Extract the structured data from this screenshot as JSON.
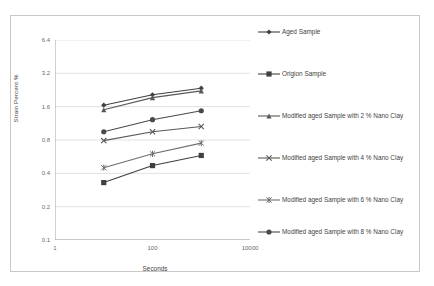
{
  "chart_data": {
    "type": "line",
    "title": "",
    "xlabel": "Seconds",
    "ylabel": "Strain Percent %",
    "xscale": "log",
    "yscale": "log",
    "xlim": [
      1,
      10000
    ],
    "ylim": [
      0.1,
      6.4
    ],
    "xticks": [
      "1",
      "100",
      "10000"
    ],
    "xtick_values": [
      1,
      100,
      10000
    ],
    "yticks": [
      "6.4",
      "3.2",
      "1.6",
      "0.8",
      "0.4",
      "0.2",
      "0.1"
    ],
    "ytick_values": [
      6.4,
      3.2,
      1.6,
      0.8,
      0.4,
      0.2,
      0.1
    ],
    "grid": true,
    "grid_axis": "y",
    "legend_position": "right",
    "x": [
      10,
      100,
      1000
    ],
    "series": [
      {
        "name": "Aged Sample",
        "marker": "diamond",
        "color": "#404040",
        "values": [
          1.65,
          2.05,
          2.35
        ]
      },
      {
        "name": "Origion Sample",
        "marker": "square",
        "color": "#404040",
        "values": [
          0.33,
          0.47,
          0.58
        ]
      },
      {
        "name": "Modified aged Sample with 2 % Nano Clay",
        "marker": "triangle",
        "color": "#595959",
        "values": [
          1.5,
          1.93,
          2.22
        ]
      },
      {
        "name": "Modified aged Sample with 4 % Nano Clay",
        "marker": "x",
        "color": "#595959",
        "values": [
          0.79,
          0.95,
          1.06
        ]
      },
      {
        "name": "Modified aged Sample with 6 % Nano Clay",
        "marker": "asterisk",
        "color": "#6e6e6e",
        "values": [
          0.45,
          0.6,
          0.75
        ]
      },
      {
        "name": "Modified aged Sample with 8 % Nano Clay",
        "marker": "circle",
        "color": "#4a4a4a",
        "values": [
          0.95,
          1.22,
          1.47
        ]
      }
    ]
  }
}
